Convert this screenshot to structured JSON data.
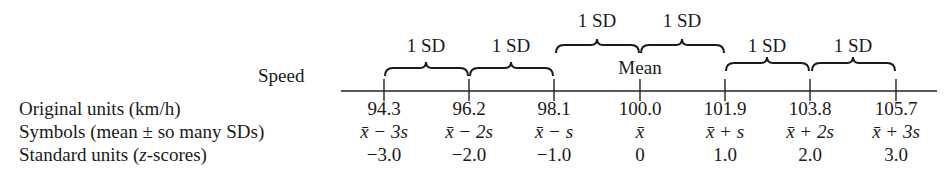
{
  "diagram": {
    "axis_label": "Speed",
    "mean_label": "Mean",
    "brace_label": "1 SD",
    "braces": [
      {
        "from_tick": 0,
        "to_tick": 1,
        "label": "1 SD",
        "level": "low"
      },
      {
        "from_tick": 1,
        "to_tick": 2,
        "label": "1 SD",
        "level": "low"
      },
      {
        "from_tick": 2,
        "to_tick": 3,
        "label": "1 SD",
        "level": "high"
      },
      {
        "from_tick": 3,
        "to_tick": 4,
        "label": "1 SD",
        "level": "high"
      },
      {
        "from_tick": 4,
        "to_tick": 5,
        "label": "1 SD",
        "level": "low"
      },
      {
        "from_tick": 5,
        "to_tick": 6,
        "label": "1 SD",
        "level": "low"
      }
    ],
    "rows": [
      {
        "label": "Original units (km/h)",
        "values": [
          "94.3",
          "96.2",
          "98.1",
          "100.0",
          "101.9",
          "103.8",
          "105.7"
        ]
      },
      {
        "label": "Symbols (mean ± so many SDs)",
        "values": [
          "x̄ − 3s",
          "x̄ − 2s",
          "x̄ − s",
          "x̄",
          "x̄ + s",
          "x̄ + 2s",
          "x̄ + 3s"
        ]
      },
      {
        "label_prefix": "Standard units (",
        "label_italic": "z",
        "label_suffix": "-scores)",
        "values": [
          "−3.0",
          "−2.0",
          "−1.0",
          "0",
          "1.0",
          "2.0",
          "3.0"
        ]
      }
    ],
    "symbols": [
      {
        "bar": "x̄",
        "op": "−",
        "k": "3",
        "s": "s"
      },
      {
        "bar": "x̄",
        "op": "−",
        "k": "2",
        "s": "s"
      },
      {
        "bar": "x̄",
        "op": "−",
        "k": "",
        "s": "s"
      },
      {
        "bar": "x̄",
        "op": "",
        "k": "",
        "s": ""
      },
      {
        "bar": "x̄",
        "op": "+",
        "k": "",
        "s": "s"
      },
      {
        "bar": "x̄",
        "op": "+",
        "k": "2",
        "s": "s"
      },
      {
        "bar": "x̄",
        "op": "+",
        "k": "3",
        "s": "s"
      }
    ]
  }
}
